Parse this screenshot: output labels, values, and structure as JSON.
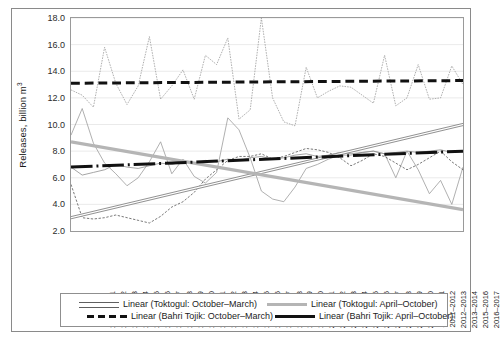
{
  "chart_data": {
    "type": "line",
    "title": "",
    "xlabel": "",
    "ylabel": "Releases, billion m",
    "ylabel_sup": "3",
    "ylim": [
      2.0,
      18.0
    ],
    "ytick_step": 2.0,
    "ytick_labels": [
      "18.0",
      "16.0",
      "14.0",
      "12.0",
      "10.0",
      "8.0",
      "6.0",
      "4.0",
      "2.0"
    ],
    "grid": true,
    "legend_position": "bottom",
    "categories": [
      "1980–1981",
      "1981–1982",
      "1982–1983",
      "1983–1984",
      "1984–1985",
      "1985–1986",
      "1986–1987",
      "1987–1988",
      "1988–1989",
      "1989–1990",
      "1990–1991",
      "1991–1992",
      "1992–1993",
      "1993–1994",
      "1994–1995",
      "1995–1996",
      "1996–1997",
      "1997–1998",
      "1998–1999",
      "1999–2000",
      "2000–2001",
      "2001–2002",
      "2002–2003",
      "2003–2004",
      "2004–2005",
      "2005–2006",
      "2006–2007",
      "2007–2008",
      "2008–2009",
      "2009–2010",
      "2010–2011",
      "2011–2012",
      "2012–2013",
      "2013–2014",
      "2015–2016",
      "2016–2017"
    ],
    "series": [
      {
        "name": "Toktogul: October–March",
        "style": "thin-solid-gray",
        "values": [
          9.2,
          11.2,
          8.6,
          7.1,
          6.3,
          5.4,
          6.0,
          7.2,
          8.7,
          6.3,
          7.4,
          6.1,
          5.6,
          6.4,
          10.5,
          9.6,
          7.5,
          5.0,
          4.4,
          4.2,
          5.3,
          6.7,
          7.0,
          7.4,
          7.7,
          7.7,
          7.9,
          8.0,
          7.8,
          6.0,
          8.0,
          6.6,
          4.8,
          5.8,
          4.0,
          6.8
        ]
      },
      {
        "name": "Toktogul: April–October",
        "style": "thin-dotted-gray",
        "values": [
          12.6,
          12.2,
          11.3,
          15.8,
          13.1,
          11.5,
          12.9,
          16.6,
          11.9,
          12.9,
          14.1,
          11.9,
          15.2,
          14.5,
          16.5,
          10.4,
          11.1,
          18.0,
          12.0,
          10.2,
          9.9,
          14.3,
          12.0,
          12.5,
          12.9,
          12.8,
          12.2,
          11.6,
          15.2,
          11.4,
          12.0,
          14.5,
          11.9,
          12.0,
          14.4,
          13.0
        ]
      },
      {
        "name": "Bahri Tojik: October–March",
        "style": "thin-dashed-dark",
        "values": [
          5.5,
          3.0,
          2.9,
          3.0,
          3.2,
          3.0,
          2.8,
          2.6,
          3.1,
          3.8,
          4.2,
          4.9,
          5.9,
          6.6,
          7.3,
          7.6,
          7.6,
          7.8,
          7.4,
          7.6,
          7.9,
          8.2,
          8.1,
          7.9,
          7.5,
          6.9,
          7.3,
          7.8,
          7.6,
          7.1,
          6.6,
          7.0,
          7.5,
          8.0,
          7.2,
          6.6
        ]
      },
      {
        "name": "Bahri Tojik: April–October",
        "style": "thin-solid-dark",
        "values": [
          6.8,
          6.2,
          6.4,
          6.6,
          7.0,
          6.8,
          6.7,
          6.9,
          7.1,
          7.0,
          7.2,
          7.1,
          7.3,
          7.2,
          7.4,
          7.3,
          7.5,
          7.6,
          7.4,
          7.5,
          7.7,
          7.8,
          7.6,
          7.7,
          7.9,
          7.8,
          7.9,
          8.0,
          7.8,
          7.9,
          8.0,
          7.9,
          8.0,
          8.1,
          7.9,
          8.0
        ]
      }
    ],
    "trendlines": [
      {
        "name": "Linear (Toktogul: October–March)",
        "style": "outlined-thin",
        "y_start": 3.0,
        "y_end": 10.0
      },
      {
        "name": "Linear (Toktogul: April–October)",
        "style": "thick-gray",
        "y_start": 8.7,
        "y_end": 3.6
      },
      {
        "name": "Linear (Bahri Tojik: October–March)",
        "style": "black-dashed",
        "y_start": 13.1,
        "y_end": 13.3
      },
      {
        "name": "Linear (Bahri Tojik: April–October)",
        "style": "black-solid",
        "y_start": 6.8,
        "y_end": 8.0
      }
    ]
  },
  "legend": {
    "items": [
      {
        "label": "Linear (Toktogul: October–March)",
        "swatch": "outlined-thin"
      },
      {
        "label": "Linear (Toktogul: April–October)",
        "swatch": "thick-gray"
      },
      {
        "label": "Linear (Bahri Tojik: October–March)",
        "swatch": "black-dashed"
      },
      {
        "label": "Linear (Bahri Tojik: April–October)",
        "swatch": "black-solid"
      }
    ]
  },
  "colors": {
    "series_gray": "#9b9b9b",
    "trend_gray": "#b5b5b5",
    "dark": "#111111",
    "grid": "#e4e4e4",
    "frame": "#9a9a9a"
  }
}
